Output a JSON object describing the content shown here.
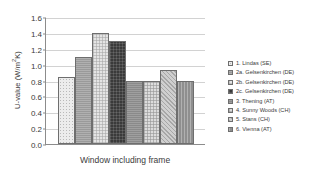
{
  "chart_data": {
    "type": "bar",
    "title": "",
    "xlabel": "Window including frame",
    "ylabel": "U-value (W/m²K)",
    "ylabel_main": "U-value (W/m",
    "ylabel_sup": "2",
    "ylabel_tail": "K)",
    "ylim": [
      0.0,
      1.6
    ],
    "ytick_step": 0.2,
    "grid": true,
    "legend_position": "right",
    "categories": [
      "Window including frame"
    ],
    "ytick_labels": [
      "1.6",
      "1.4",
      "1.2",
      "1.0",
      "0.8",
      "0.6",
      "0.4",
      "0.2",
      "0.0"
    ],
    "ytick_values": [
      1.6,
      1.4,
      1.2,
      1.0,
      0.8,
      0.6,
      0.4,
      0.2,
      0.0
    ],
    "series": [
      {
        "name": "1. Lindas (SE)",
        "value": 0.85,
        "pattern": "p-dot-light"
      },
      {
        "name": "2a. Gelsenkirchen (DE)",
        "value": 1.1,
        "pattern": "p-solid-mid"
      },
      {
        "name": "2b. Gelsenkirchen (DE)",
        "value": 1.4,
        "pattern": "p-check-light"
      },
      {
        "name": "2c. Gelsenkirchen (DE)",
        "value": 1.3,
        "pattern": "p-dark"
      },
      {
        "name": "3. Thening (AT)",
        "value": 0.79,
        "pattern": "p-solid-dark"
      },
      {
        "name": "4. Sunny Woods (CH)",
        "value": 0.8,
        "pattern": "p-check-mid"
      },
      {
        "name": "5. Stans (CH)",
        "value": 0.93,
        "pattern": "p-diag"
      },
      {
        "name": "6. Vienna (AT)",
        "value": 0.79,
        "pattern": "p-vert"
      }
    ]
  }
}
